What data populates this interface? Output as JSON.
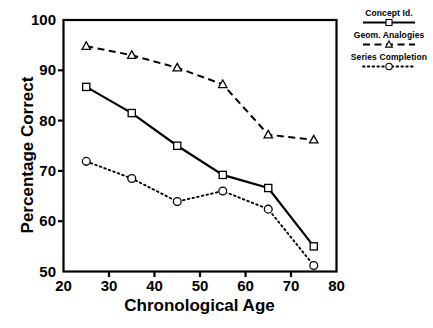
{
  "chart_data": {
    "type": "line",
    "title": "",
    "subtitle": "",
    "xlabel": "Chronological Age",
    "ylabel": "Percentage Correct",
    "x": [
      25,
      35,
      45,
      55,
      65,
      75
    ],
    "xlim": [
      20,
      80
    ],
    "ylim": [
      50,
      100
    ],
    "xticks": [
      "20",
      "30",
      "40",
      "50",
      "60",
      "70",
      "80"
    ],
    "yticks": [
      "100",
      "90",
      "80",
      "70",
      "60",
      "50"
    ],
    "xtick_values": [
      20,
      30,
      40,
      50,
      60,
      70,
      80
    ],
    "ytick_values": [
      100,
      90,
      80,
      70,
      60,
      50
    ],
    "grid": false,
    "legend_position": "outside-right-top",
    "series": [
      {
        "name": "Concept Id.",
        "marker": "square",
        "linestyle": "solid",
        "color": "#000000",
        "values": [
          86.7,
          81.5,
          75.0,
          69.2,
          66.6,
          55.0
        ]
      },
      {
        "name": "Geom. Analogies",
        "marker": "triangle",
        "linestyle": "dashed",
        "color": "#000000",
        "values": [
          94.8,
          93.0,
          90.5,
          87.2,
          77.2,
          76.2
        ]
      },
      {
        "name": "Series Completion",
        "marker": "circle",
        "linestyle": "dotted",
        "color": "#000000",
        "values": [
          71.9,
          68.5,
          63.9,
          66.0,
          62.4,
          51.2
        ]
      }
    ]
  },
  "legend": {
    "items": [
      {
        "label": "Concept Id."
      },
      {
        "label": "Geom. Analogies"
      },
      {
        "label": "Series Completion"
      }
    ]
  },
  "axes": {
    "frame_color": "#000000"
  }
}
